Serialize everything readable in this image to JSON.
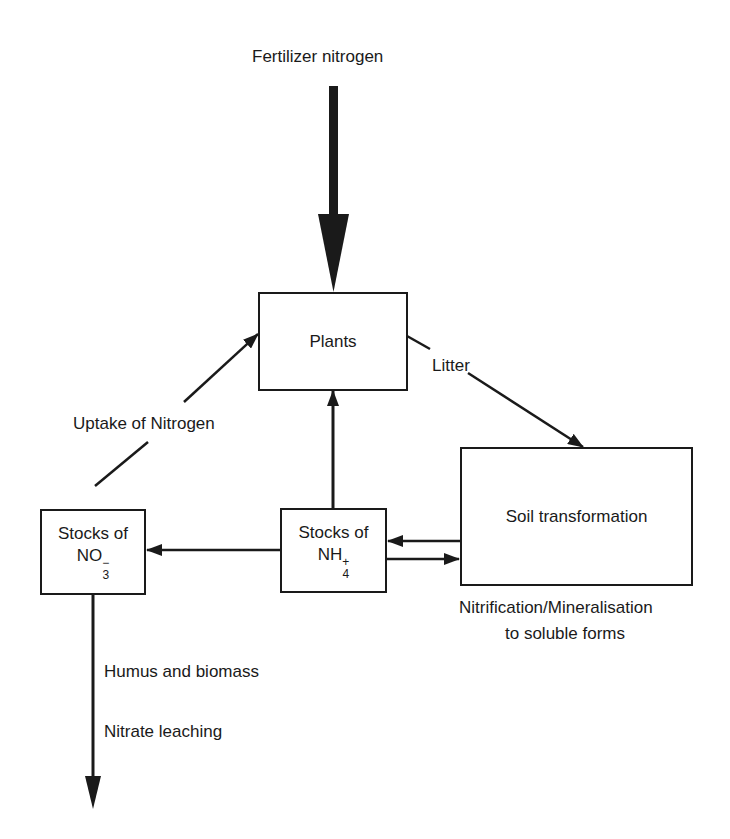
{
  "diagram": {
    "title": "Fertilizer nitrogen",
    "nodes": {
      "plants": {
        "label": "Plants"
      },
      "soil": {
        "label": "Soil transformation"
      },
      "nh4": {
        "line1": "Stocks of",
        "formula": "NH",
        "sup": "+",
        "sub": "4"
      },
      "no3": {
        "line1": "Stocks of",
        "formula": "NO",
        "sup": "−",
        "sub": "3"
      }
    },
    "edge_labels": {
      "litter": "Litter",
      "uptake": "Uptake of Nitrogen",
      "soil_caption_1": "Nitrification/Mineralisation",
      "soil_caption_2": "to soluble forms",
      "humus": "Humus and biomass",
      "leaching": "Nitrate leaching"
    },
    "edges": [
      {
        "from": "Fertilizer nitrogen",
        "to": "Plants",
        "style": "thick"
      },
      {
        "from": "Plants",
        "to": "Soil transformation",
        "label": "Litter"
      },
      {
        "from": "Stocks of NO3-",
        "to": "Plants",
        "label": "Uptake of Nitrogen"
      },
      {
        "from": "Stocks of NH4+",
        "to": "Plants"
      },
      {
        "from": "Stocks of NH4+",
        "to": "Stocks of NO3-"
      },
      {
        "from": "Soil transformation",
        "to": "Stocks of NH4+"
      },
      {
        "from": "Stocks of NH4+",
        "to": "Soil transformation"
      },
      {
        "from": "Stocks of NO3-",
        "to": "out",
        "label": "Nitrate leaching"
      }
    ]
  }
}
